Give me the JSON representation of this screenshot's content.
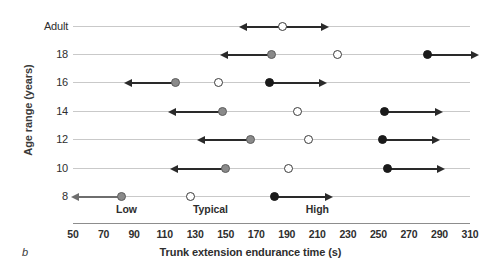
{
  "panel": {
    "label": "b"
  },
  "axes": {
    "ylabel": "Age range (years)",
    "xlabel": "Trunk extension endurance time (s)",
    "xticks": [
      50,
      70,
      90,
      110,
      130,
      150,
      170,
      190,
      210,
      230,
      250,
      270,
      290,
      310
    ],
    "xlim": [
      50,
      310
    ],
    "categories": [
      "Adult",
      "18",
      "16",
      "14",
      "12",
      "10",
      "8"
    ]
  },
  "bands": [
    {
      "name": "Low",
      "label": "Low",
      "value": 85
    },
    {
      "name": "Typical",
      "label": "Typical",
      "value": 140
    },
    {
      "name": "High",
      "label": "High",
      "value": 210
    }
  ],
  "chart_data": {
    "type": "scatter",
    "title": "",
    "xlabel": "Trunk extension endurance time (s)",
    "ylabel": "Age range (years)",
    "xlim": [
      50,
      310
    ],
    "xticks": [
      50,
      70,
      90,
      110,
      130,
      150,
      170,
      190,
      210,
      230,
      250,
      270,
      290,
      310
    ],
    "categories": [
      "Adult",
      "18",
      "16",
      "14",
      "12",
      "10",
      "8"
    ],
    "grid": false,
    "legend": [
      "Low",
      "Typical",
      "High"
    ],
    "series": [
      {
        "name": "Low",
        "marker": "gray-filled-circle",
        "values": [
          null,
          180,
          117,
          148,
          166,
          150,
          82
        ]
      },
      {
        "name": "Typical",
        "marker": "open-circle",
        "values": [
          187,
          223,
          145,
          197,
          204,
          191,
          127
        ]
      },
      {
        "name": "High",
        "marker": "black-filled-circle",
        "values": [
          null,
          282,
          179,
          254,
          253,
          256,
          182
        ]
      }
    ],
    "rows": [
      {
        "category": "Adult",
        "points": [
          {
            "band": "Typical",
            "value": 187,
            "arrow": "both",
            "arrow_from": 163,
            "arrow_to": 213
          }
        ]
      },
      {
        "category": "18",
        "points": [
          {
            "band": "Low",
            "value": 180,
            "arrow": "left",
            "arrow_from": 180,
            "arrow_to": 151
          },
          {
            "band": "Typical",
            "value": 223,
            "arrow": "none"
          },
          {
            "band": "High",
            "value": 282,
            "arrow": "right",
            "arrow_from": 282,
            "arrow_to": 311
          }
        ]
      },
      {
        "category": "16",
        "points": [
          {
            "band": "Low",
            "value": 117,
            "arrow": "left",
            "arrow_from": 117,
            "arrow_to": 88
          },
          {
            "band": "Typical",
            "value": 145,
            "arrow": "none"
          },
          {
            "band": "High",
            "value": 179,
            "arrow": "right",
            "arrow_from": 179,
            "arrow_to": 212
          }
        ]
      },
      {
        "category": "14",
        "points": [
          {
            "band": "Low",
            "value": 148,
            "arrow": "left",
            "arrow_from": 148,
            "arrow_to": 117
          },
          {
            "band": "Typical",
            "value": 197,
            "arrow": "none"
          },
          {
            "band": "High",
            "value": 254,
            "arrow": "right",
            "arrow_from": 254,
            "arrow_to": 288
          }
        ]
      },
      {
        "category": "12",
        "points": [
          {
            "band": "Low",
            "value": 166,
            "arrow": "left",
            "arrow_from": 166,
            "arrow_to": 136
          },
          {
            "band": "Typical",
            "value": 204,
            "arrow": "none"
          },
          {
            "band": "High",
            "value": 253,
            "arrow": "right",
            "arrow_from": 253,
            "arrow_to": 286
          }
        ]
      },
      {
        "category": "10",
        "points": [
          {
            "band": "Low",
            "value": 150,
            "arrow": "left",
            "arrow_from": 150,
            "arrow_to": 118
          },
          {
            "band": "Typical",
            "value": 191,
            "arrow": "none"
          },
          {
            "band": "High",
            "value": 256,
            "arrow": "right",
            "arrow_from": 256,
            "arrow_to": 289
          }
        ]
      },
      {
        "category": "8",
        "points": [
          {
            "band": "Low",
            "value": 82,
            "arrow": "left",
            "arrow_from": 82,
            "arrow_to": 53
          },
          {
            "band": "Typical",
            "value": 127,
            "arrow": "none"
          },
          {
            "band": "High",
            "value": 182,
            "arrow": "right",
            "arrow_from": 182,
            "arrow_to": 216
          }
        ]
      }
    ]
  },
  "colors": {
    "low": "#8a8a8a",
    "typical": "#ffffff",
    "high": "#1a1a1a",
    "axis": "#8d8d8d",
    "gridline": "#c9c9c9",
    "text": "#2e2e2e"
  }
}
